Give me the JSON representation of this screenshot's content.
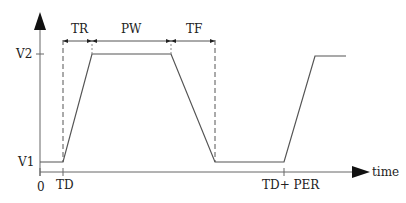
{
  "diagram": {
    "segment_labels": {
      "tr": "TR",
      "pw": "PW",
      "tf": "TF"
    },
    "y_labels": {
      "v2": "V2",
      "v1": "V1"
    },
    "x_labels": {
      "origin": "0",
      "td": "TD",
      "td_per": "TD+ PER"
    },
    "axis_label": "time",
    "colors": {
      "line": "#555555",
      "arrow": "#111111",
      "text": "#222222"
    }
  }
}
